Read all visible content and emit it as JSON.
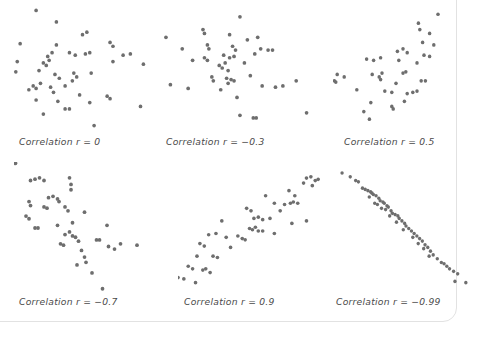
{
  "figure": {
    "type": "scatter-matrix",
    "dot_color": "#6e6e6e",
    "background_color": "#ffffff",
    "caption_color": "#4a4a4a",
    "border_color": "#e2e2e2"
  },
  "chart_data": [
    {
      "type": "scatter",
      "title": "Correlation r = 0",
      "r": 0,
      "xlabel": "",
      "ylabel": "",
      "xlim": [
        0,
        100
      ],
      "ylim": [
        0,
        100
      ],
      "grid": false,
      "legend": "none",
      "points": [
        [
          18,
          95
        ],
        [
          32,
          86
        ],
        [
          50,
          76
        ],
        [
          53,
          78
        ],
        [
          7,
          69
        ],
        [
          32,
          68
        ],
        [
          69,
          70
        ],
        [
          71,
          67
        ],
        [
          55,
          62
        ],
        [
          29,
          62
        ],
        [
          26,
          59
        ],
        [
          27,
          56
        ],
        [
          41,
          62
        ],
        [
          45,
          60
        ],
        [
          52,
          61
        ],
        [
          78,
          60
        ],
        [
          83,
          61
        ],
        [
          5,
          55
        ],
        [
          23,
          54
        ],
        [
          25,
          52
        ],
        [
          71,
          55
        ],
        [
          92,
          53
        ],
        [
          4,
          47
        ],
        [
          20,
          48
        ],
        [
          31,
          45
        ],
        [
          44,
          46
        ],
        [
          46,
          43
        ],
        [
          56,
          46
        ],
        [
          34,
          42
        ],
        [
          43,
          40
        ],
        [
          16,
          36
        ],
        [
          18,
          34
        ],
        [
          21,
          38
        ],
        [
          28,
          35
        ],
        [
          38,
          36
        ],
        [
          13,
          33
        ],
        [
          30,
          31
        ],
        [
          48,
          29
        ],
        [
          67,
          28
        ],
        [
          69,
          26
        ],
        [
          18,
          25
        ],
        [
          33,
          24
        ],
        [
          55,
          23
        ],
        [
          38,
          18
        ],
        [
          41,
          18
        ],
        [
          90,
          20
        ],
        [
          23,
          14
        ],
        [
          58,
          5
        ]
      ]
    },
    {
      "type": "scatter",
      "title": "Correlation r = -0.3",
      "r": -0.3,
      "xlabel": "",
      "ylabel": "",
      "xlim": [
        0,
        100
      ],
      "ylim": [
        0,
        100
      ],
      "grid": false,
      "legend": "none",
      "points": [
        [
          52,
          90
        ],
        [
          27,
          80
        ],
        [
          28,
          77
        ],
        [
          45,
          76
        ],
        [
          64,
          74
        ],
        [
          2,
          74
        ],
        [
          30,
          68
        ],
        [
          31,
          65
        ],
        [
          47,
          67
        ],
        [
          49,
          64
        ],
        [
          57,
          72
        ],
        [
          13,
          65
        ],
        [
          66,
          65
        ],
        [
          71,
          64
        ],
        [
          74,
          64
        ],
        [
          28,
          58
        ],
        [
          30,
          56
        ],
        [
          41,
          60
        ],
        [
          45,
          58
        ],
        [
          48,
          59
        ],
        [
          20,
          56
        ],
        [
          62,
          61
        ],
        [
          38,
          52
        ],
        [
          40,
          50
        ],
        [
          42,
          54
        ],
        [
          44,
          48
        ],
        [
          55,
          54
        ],
        [
          33,
          43
        ],
        [
          34,
          40
        ],
        [
          43,
          42
        ],
        [
          44,
          38
        ],
        [
          46,
          41
        ],
        [
          48,
          40
        ],
        [
          59,
          44
        ],
        [
          5,
          37
        ],
        [
          17,
          34
        ],
        [
          39,
          33
        ],
        [
          67,
          36
        ],
        [
          76,
          35
        ],
        [
          81,
          36
        ],
        [
          50,
          27
        ],
        [
          90,
          40
        ],
        [
          52,
          13
        ],
        [
          61,
          11
        ],
        [
          63,
          11
        ],
        [
          97,
          15
        ]
      ]
    },
    {
      "type": "scatter",
      "title": "Correlation r = 0.5",
      "r": 0.5,
      "xlabel": "",
      "ylabel": "",
      "xlim": [
        0,
        100
      ],
      "ylim": [
        0,
        100
      ],
      "grid": false,
      "legend": "none",
      "points": [
        [
          75,
          92
        ],
        [
          61,
          85
        ],
        [
          62,
          80
        ],
        [
          69,
          77
        ],
        [
          64,
          70
        ],
        [
          72,
          68
        ],
        [
          46,
          63
        ],
        [
          50,
          65
        ],
        [
          53,
          62
        ],
        [
          65,
          60
        ],
        [
          69,
          59
        ],
        [
          24,
          57
        ],
        [
          29,
          56
        ],
        [
          34,
          58
        ],
        [
          47,
          56
        ],
        [
          60,
          54
        ],
        [
          3,
          45
        ],
        [
          8,
          43
        ],
        [
          1,
          40
        ],
        [
          2,
          39
        ],
        [
          28,
          45
        ],
        [
          33,
          43
        ],
        [
          34,
          41
        ],
        [
          35,
          46
        ],
        [
          50,
          46
        ],
        [
          52,
          47
        ],
        [
          45,
          38
        ],
        [
          63,
          40
        ],
        [
          66,
          40
        ],
        [
          17,
          33
        ],
        [
          37,
          32
        ],
        [
          42,
          31
        ],
        [
          53,
          30
        ],
        [
          57,
          31
        ],
        [
          60,
          32
        ],
        [
          27,
          23
        ],
        [
          42,
          20
        ],
        [
          43,
          18
        ],
        [
          51,
          24
        ],
        [
          22,
          16
        ],
        [
          26,
          10
        ]
      ]
    },
    {
      "type": "scatter",
      "title": "Correlation r = -0.7",
      "r": -0.7,
      "xlabel": "",
      "ylabel": "",
      "xlim": [
        0,
        100
      ],
      "ylim": [
        0,
        100
      ],
      "grid": false,
      "legend": "none",
      "points": [
        [
          1,
          99
        ],
        [
          11,
          86
        ],
        [
          14,
          87
        ],
        [
          17,
          88
        ],
        [
          20,
          86
        ],
        [
          37,
          88
        ],
        [
          38,
          83
        ],
        [
          38,
          79
        ],
        [
          23,
          73
        ],
        [
          26,
          74
        ],
        [
          29,
          72
        ],
        [
          30,
          70
        ],
        [
          10,
          70
        ],
        [
          11,
          67
        ],
        [
          20,
          66
        ],
        [
          22,
          65
        ],
        [
          34,
          66
        ],
        [
          36,
          63
        ],
        [
          8,
          59
        ],
        [
          10,
          57
        ],
        [
          47,
          62
        ],
        [
          14,
          50
        ],
        [
          16,
          50
        ],
        [
          29,
          52
        ],
        [
          39,
          54
        ],
        [
          62,
          52
        ],
        [
          34,
          45
        ],
        [
          37,
          47
        ],
        [
          39,
          44
        ],
        [
          41,
          43
        ],
        [
          31,
          38
        ],
        [
          33,
          37
        ],
        [
          43,
          40
        ],
        [
          55,
          41
        ],
        [
          57,
          41
        ],
        [
          45,
          33
        ],
        [
          63,
          36
        ],
        [
          67,
          34
        ],
        [
          71,
          38
        ],
        [
          82,
          37
        ],
        [
          47,
          28
        ],
        [
          48,
          24
        ],
        [
          42,
          22
        ],
        [
          52,
          16
        ],
        [
          59,
          4
        ]
      ]
    },
    {
      "type": "scatter",
      "title": "Correlation r = 0.9",
      "r": 0.9,
      "xlabel": "",
      "ylabel": "",
      "xlim": [
        0,
        100
      ],
      "ylim": [
        0,
        100
      ],
      "grid": false,
      "legend": "none",
      "points": [
        [
          88,
          92
        ],
        [
          91,
          93
        ],
        [
          94,
          90
        ],
        [
          96,
          91
        ],
        [
          92,
          86
        ],
        [
          86,
          88
        ],
        [
          76,
          82
        ],
        [
          80,
          78
        ],
        [
          60,
          78
        ],
        [
          66,
          72
        ],
        [
          77,
          72
        ],
        [
          79,
          73
        ],
        [
          82,
          72
        ],
        [
          73,
          71
        ],
        [
          47,
          68
        ],
        [
          50,
          66
        ],
        [
          70,
          66
        ],
        [
          52,
          60
        ],
        [
          55,
          61
        ],
        [
          58,
          59
        ],
        [
          63,
          60
        ],
        [
          30,
          58
        ],
        [
          78,
          56
        ],
        [
          88,
          58
        ],
        [
          49,
          52
        ],
        [
          51,
          51
        ],
        [
          53,
          53
        ],
        [
          55,
          50
        ],
        [
          58,
          50
        ],
        [
          66,
          48
        ],
        [
          21,
          47
        ],
        [
          26,
          48
        ],
        [
          33,
          45
        ],
        [
          41,
          46
        ],
        [
          44,
          44
        ],
        [
          46,
          43
        ],
        [
          15,
          40
        ],
        [
          18,
          38
        ],
        [
          36,
          37
        ],
        [
          13,
          30
        ],
        [
          24,
          30
        ],
        [
          27,
          29
        ],
        [
          7,
          22
        ],
        [
          10,
          20
        ],
        [
          17,
          19
        ],
        [
          19,
          20
        ],
        [
          22,
          17
        ],
        [
          0,
          13
        ],
        [
          4,
          12
        ],
        [
          12,
          9
        ]
      ]
    },
    {
      "type": "scatter",
      "title": "Correlation r = -0.99",
      "r": -0.99,
      "xlabel": "",
      "ylabel": "",
      "xlim": [
        0,
        100
      ],
      "ylim": [
        0,
        100
      ],
      "grid": false,
      "legend": "none",
      "points": [
        [
          3,
          96
        ],
        [
          9,
          93
        ],
        [
          13,
          90
        ],
        [
          15,
          89
        ],
        [
          18,
          84
        ],
        [
          20,
          83
        ],
        [
          22,
          82
        ],
        [
          24,
          81
        ],
        [
          25,
          80
        ],
        [
          26,
          79
        ],
        [
          23,
          77
        ],
        [
          28,
          78
        ],
        [
          30,
          76
        ],
        [
          31,
          74
        ],
        [
          33,
          73
        ],
        [
          27,
          72
        ],
        [
          29,
          71
        ],
        [
          34,
          72
        ],
        [
          36,
          70
        ],
        [
          37,
          69
        ],
        [
          32,
          68
        ],
        [
          35,
          67
        ],
        [
          39,
          66
        ],
        [
          40,
          64
        ],
        [
          42,
          63
        ],
        [
          38,
          62
        ],
        [
          44,
          62
        ],
        [
          45,
          60
        ],
        [
          47,
          58
        ],
        [
          43,
          57
        ],
        [
          49,
          56
        ],
        [
          50,
          54
        ],
        [
          52,
          52
        ],
        [
          48,
          51
        ],
        [
          54,
          50
        ],
        [
          56,
          48
        ],
        [
          58,
          46
        ],
        [
          55,
          45
        ],
        [
          60,
          44
        ],
        [
          62,
          42
        ],
        [
          59,
          40
        ],
        [
          64,
          39
        ],
        [
          66,
          37
        ],
        [
          63,
          36
        ],
        [
          68,
          34
        ],
        [
          70,
          31
        ],
        [
          67,
          30
        ],
        [
          73,
          28
        ],
        [
          76,
          25
        ],
        [
          78,
          24
        ],
        [
          80,
          22
        ],
        [
          82,
          20
        ],
        [
          85,
          18
        ],
        [
          88,
          16
        ],
        [
          86,
          10
        ],
        [
          94,
          9
        ]
      ]
    }
  ],
  "panels": [
    {
      "name": "panel-r-0",
      "caption": "Correlation r = 0",
      "chart_index": 0
    },
    {
      "name": "panel-r-neg-0-3",
      "caption": "Correlation r = −0.3",
      "chart_index": 1
    },
    {
      "name": "panel-r-0-5",
      "caption": "Correlation r = 0.5",
      "chart_index": 2
    },
    {
      "name": "panel-r-neg-0-7",
      "caption": "Correlation r = −0.7",
      "chart_index": 3
    },
    {
      "name": "panel-r-0-9",
      "caption": "Correlation r = 0.9",
      "chart_index": 4
    },
    {
      "name": "panel-r-neg-0-99",
      "caption": "Correlation r = −0.99",
      "chart_index": 5
    }
  ]
}
